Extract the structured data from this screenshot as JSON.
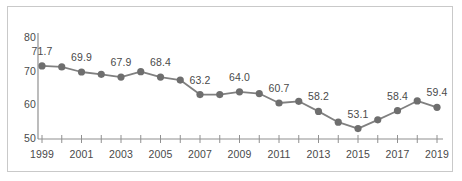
{
  "chart_data": {
    "type": "line",
    "title": "",
    "subtitle": "",
    "xlabel": "",
    "ylabel": "",
    "grid": false,
    "legend": null,
    "legend_position": "none",
    "line_color": "#808080",
    "marker_color": "#6e6e6e",
    "axis_color": "#909090",
    "label_color": "#4a4a4a",
    "border_color": "#c9c9c9",
    "background_color": "#ffffff",
    "x": [
      1999,
      2000,
      2001,
      2002,
      2003,
      2004,
      2005,
      2006,
      2007,
      2008,
      2009,
      2010,
      2011,
      2012,
      2013,
      2014,
      2015,
      2016,
      2017,
      2018,
      2019
    ],
    "values": [
      71.7,
      71.4,
      69.9,
      69.2,
      68.4,
      70.0,
      68.4,
      67.5,
      63.2,
      63.2,
      64.0,
      63.5,
      60.7,
      61.2,
      58.2,
      55.0,
      53.1,
      55.7,
      58.4,
      61.3,
      59.4
    ],
    "point_labels": [
      "71.7",
      "",
      "69.9",
      "",
      "67.9",
      "",
      "68.4",
      "",
      "63.2",
      "",
      "64.0",
      "",
      "60.7",
      "",
      "58.2",
      "",
      "53.1",
      "",
      "58.4",
      "",
      "59.4"
    ],
    "xticks": [
      "1999",
      "",
      "2001",
      "",
      "2003",
      "",
      "2005",
      "",
      "2007",
      "",
      "2009",
      "",
      "2011",
      "",
      "2013",
      "",
      "2015",
      "",
      "2017",
      "",
      "2019"
    ],
    "yticks": [
      "50",
      "60",
      "70",
      "80"
    ],
    "ytick_values": [
      50,
      60,
      70,
      80
    ],
    "ylim": [
      50,
      83
    ],
    "xlim": [
      1999,
      2019
    ]
  }
}
